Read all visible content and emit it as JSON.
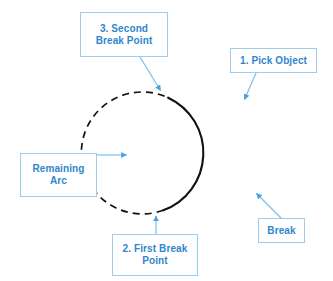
{
  "diagram": {
    "colors": {
      "callout_border": "#9ccdee",
      "callout_text": "#2f86cb",
      "leader_line": "#7fbce6",
      "arrowhead": "#4aa3e0",
      "solid_arc": "#111111",
      "dashed_arc": "#111111",
      "background": "#ffffff"
    },
    "circle": {
      "center_x": 189,
      "center_y": 155,
      "radius": 61,
      "solid_arc_start_deg": 115,
      "solid_arc_end_deg": 250,
      "dash_pattern": "7 5"
    },
    "callouts": [
      {
        "id": "second-break-point",
        "label": "3. Second\nBreak Point",
        "anchor_x": 162,
        "anchor_y": 92
      },
      {
        "id": "pick-object",
        "label": "1. Pick Object",
        "anchor_x": 243,
        "anchor_y": 101
      },
      {
        "id": "remaining-arc",
        "label": "Remaining\nArc",
        "anchor_x": 128,
        "anchor_y": 155
      },
      {
        "id": "break",
        "label": "Break",
        "anchor_x": 255,
        "anchor_y": 192
      },
      {
        "id": "first-break-point",
        "label": "2. First Break\nPoint",
        "anchor_x": 156,
        "anchor_y": 214
      }
    ]
  }
}
